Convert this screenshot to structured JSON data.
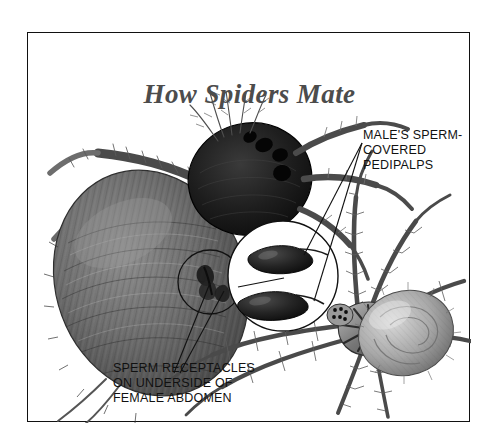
{
  "figure": {
    "title": "How Spiders Mate",
    "type": "illustration",
    "background_color": "#ffffff",
    "frame_color": "#111111",
    "title_color": "#4c4c4c",
    "label_color": "#111111"
  },
  "callouts": [
    {
      "name": "male-pedipalps",
      "lines": [
        "MALE'S SPERM-",
        "COVERED",
        "PEDIPALPS"
      ],
      "leader_count": 2,
      "points_to": "magnified-pedipalp-circle"
    },
    {
      "name": "female-receptacles",
      "lines": [
        "SPERM RECEPTACLES",
        "ON UNDERSIDE OF",
        "FEMALE ABDOMEN"
      ],
      "leader_count": 2,
      "points_to": "epigynum-circle"
    }
  ],
  "anatomy": {
    "female": {
      "name": "female spider",
      "position": "left",
      "abdomen": "large dark-grey hairy ovoid",
      "detail_circle": "epigynum with two sperm receptacle openings"
    },
    "male": {
      "name": "male spider",
      "position": "right",
      "body": "smaller striped cephalothorax with hairy legs",
      "detail_circle": "two dark sperm-covered pedipalp bulbs"
    }
  }
}
